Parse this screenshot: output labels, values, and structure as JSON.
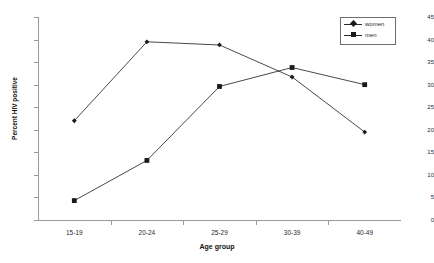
{
  "chart_data": {
    "type": "line",
    "title": "",
    "xlabel": "Age group",
    "ylabel": "Percent HIV positive",
    "categories": [
      "15-19",
      "20-24",
      "25-29",
      "30-39",
      "40-49"
    ],
    "ylim": [
      0,
      45
    ],
    "yticks": [
      0,
      5,
      10,
      15,
      20,
      25,
      30,
      35,
      40,
      45
    ],
    "grid": false,
    "legend_position": "top-right",
    "series": [
      {
        "name": "women",
        "marker": "diamond",
        "color": "#1a1a1a",
        "values": [
          22.0,
          39.5,
          38.8,
          31.7,
          19.5
        ]
      },
      {
        "name": "men",
        "marker": "square",
        "color": "#1a1a1a",
        "values": [
          4.3,
          13.2,
          29.6,
          33.8,
          30.0
        ]
      }
    ]
  },
  "legend": {
    "entries": [
      {
        "label": "women"
      },
      {
        "label": "men"
      }
    ]
  },
  "axes": {
    "y_title": "Percent HIV positive",
    "x_title": "Age group",
    "y_tick_labels": [
      "0",
      "5",
      "10",
      "15",
      "20",
      "25",
      "30",
      "35",
      "40",
      "45"
    ],
    "x_tick_labels": [
      "15-19",
      "20-24",
      "25-29",
      "30-39",
      "40-49"
    ]
  },
  "colors": {
    "axis": "#9a9a9a",
    "series_women": "#1a1a1a",
    "series_men": "#808080",
    "text": "#2b2b2b",
    "background": "#ffffff"
  }
}
